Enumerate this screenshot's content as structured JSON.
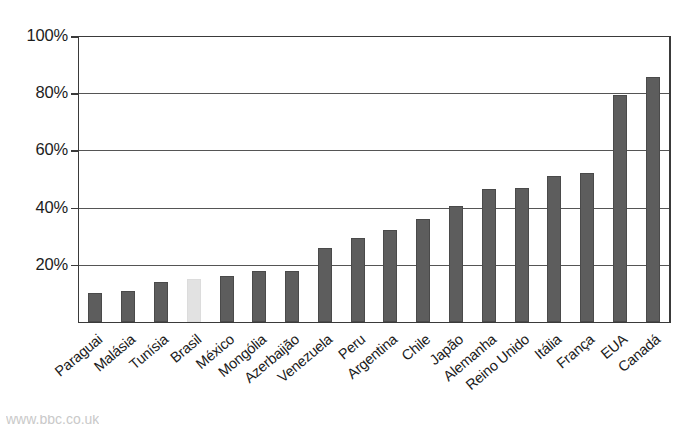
{
  "chart_data": {
    "type": "bar",
    "title": "",
    "subtitle": "",
    "xlabel": "",
    "ylabel": "",
    "ylim": [
      0,
      100
    ],
    "y_ticks": [
      "20%",
      "40%",
      "60%",
      "80%",
      "100%"
    ],
    "y_tick_values": [
      20,
      40,
      60,
      80,
      100
    ],
    "grid": true,
    "legend": "none",
    "value_suffix": "%",
    "categories": [
      "Paraguai",
      "Malásia",
      "Tunísia",
      "Brasil",
      "México",
      "Mongólia",
      "Azerbaijão",
      "Venezuela",
      "Peru",
      "Argentina",
      "Chile",
      "Japão",
      "Alemanha",
      "Reino Unido",
      "Itália",
      "França",
      "EUA",
      "Canadá"
    ],
    "values": [
      10,
      11,
      14,
      15,
      16,
      18,
      18,
      26,
      29.5,
      32,
      36,
      40.5,
      46.5,
      47,
      51,
      52,
      79.5,
      85.5
    ],
    "highlight_index": 3,
    "colors": {
      "bar": "#5d5d5d",
      "bar_highlight": "#e2e2e2",
      "axis": "#3a3a3a",
      "grid": "#555555",
      "text": "#1c1c1c"
    }
  },
  "top_cut_text": "",
  "bottom_cut_text": "www.bbc.co.uk"
}
